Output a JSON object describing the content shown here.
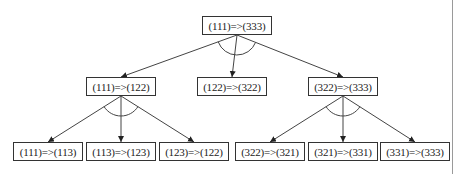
{
  "diagram": {
    "type": "tree",
    "colors": {
      "line": "#444444",
      "box_border": "#333333",
      "text": "#222222"
    },
    "nodes": [
      {
        "id": "root",
        "label": "(111)=>(333)",
        "level": 0
      },
      {
        "id": "m1",
        "label": "(111)=>(122)",
        "level": 1,
        "parent": "root"
      },
      {
        "id": "m2",
        "label": "(122)=>(322)",
        "level": 1,
        "parent": "root"
      },
      {
        "id": "m3",
        "label": "(322)=>(333)",
        "level": 1,
        "parent": "root"
      },
      {
        "id": "b1",
        "label": "(111)=>(113)",
        "level": 2,
        "parent": "m1"
      },
      {
        "id": "b2",
        "label": "(113)=>(123)",
        "level": 2,
        "parent": "m1"
      },
      {
        "id": "b3",
        "label": "(123)=>(122)",
        "level": 2,
        "parent": "m1"
      },
      {
        "id": "b4",
        "label": "(322)=>(321)",
        "level": 2,
        "parent": "m3"
      },
      {
        "id": "b5",
        "label": "(321)=>(331)",
        "level": 2,
        "parent": "m3"
      },
      {
        "id": "b6",
        "label": "(331)=>(333)",
        "level": 2,
        "parent": "m3"
      }
    ],
    "and_groups": [
      {
        "parent": "root",
        "children": [
          "m1",
          "m2",
          "m3"
        ]
      },
      {
        "parent": "m1",
        "children": [
          "b1",
          "b2",
          "b3"
        ]
      },
      {
        "parent": "m3",
        "children": [
          "b4",
          "b5",
          "b6"
        ]
      }
    ]
  }
}
